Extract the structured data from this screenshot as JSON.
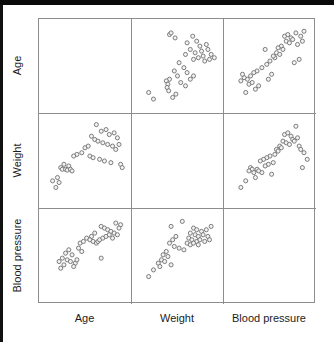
{
  "figure": {
    "type": "scatter-plot-matrix",
    "variables": [
      "Age",
      "Weight",
      "Blood pressure"
    ],
    "row_labels": [
      "Age",
      "Weight",
      "Blood pressure"
    ],
    "col_labels": [
      "Age",
      "Weight",
      "Blood pressure"
    ],
    "marker": {
      "shape": "open-circle",
      "radius_px": 2.2,
      "fill": "#f2f2f2",
      "stroke": "#6f6f6f"
    },
    "grid_line_color": "#8d8d8d",
    "background": "#ffffff",
    "diagonal": "empty"
  },
  "chart_data": {
    "type": "scatter",
    "title": "",
    "xlabel": "",
    "ylabel": "",
    "grid": false,
    "legend": null,
    "matrix": {
      "rows": [
        "Age",
        "Weight",
        "Blood pressure"
      ],
      "cols": [
        "Age",
        "Weight",
        "Blood pressure"
      ],
      "diagonal_empty": true,
      "n_points": 38,
      "axis_range_normalized": [
        0,
        100
      ]
    },
    "panels": [
      {
        "row": "Age",
        "col": "Age",
        "empty": true,
        "points": []
      },
      {
        "row": "Age",
        "col": "Weight",
        "empty": false,
        "xlabel": "Weight",
        "ylabel": "Age",
        "points": [
          [
            40,
            12
          ],
          [
            42,
            10
          ],
          [
            47,
            16
          ],
          [
            62,
            22
          ],
          [
            69,
            14
          ],
          [
            74,
            20
          ],
          [
            78,
            26
          ],
          [
            66,
            30
          ],
          [
            72,
            34
          ],
          [
            60,
            36
          ],
          [
            80,
            32
          ],
          [
            86,
            24
          ],
          [
            88,
            30
          ],
          [
            92,
            36
          ],
          [
            70,
            42
          ],
          [
            76,
            40
          ],
          [
            82,
            38
          ],
          [
            84,
            44
          ],
          [
            90,
            42
          ],
          [
            96,
            40
          ],
          [
            52,
            46
          ],
          [
            58,
            52
          ],
          [
            46,
            56
          ],
          [
            62,
            58
          ],
          [
            50,
            62
          ],
          [
            40,
            66
          ],
          [
            36,
            68
          ],
          [
            38,
            72
          ],
          [
            37,
            76
          ],
          [
            39,
            80
          ],
          [
            54,
            70
          ],
          [
            60,
            74
          ],
          [
            66,
            66
          ],
          [
            70,
            62
          ],
          [
            48,
            84
          ],
          [
            14,
            82
          ],
          [
            20,
            90
          ],
          [
            44,
            88
          ]
        ]
      },
      {
        "row": "Age",
        "col": "Blood pressure",
        "empty": false,
        "xlabel": "Blood pressure",
        "ylabel": "Age",
        "points": [
          [
            68,
            14
          ],
          [
            72,
            12
          ],
          [
            76,
            16
          ],
          [
            82,
            10
          ],
          [
            88,
            14
          ],
          [
            92,
            8
          ],
          [
            70,
            20
          ],
          [
            74,
            22
          ],
          [
            78,
            18
          ],
          [
            84,
            24
          ],
          [
            90,
            20
          ],
          [
            64,
            26
          ],
          [
            66,
            30
          ],
          [
            60,
            28
          ],
          [
            58,
            34
          ],
          [
            62,
            36
          ],
          [
            56,
            40
          ],
          [
            54,
            38
          ],
          [
            50,
            44
          ],
          [
            44,
            30
          ],
          [
            46,
            48
          ],
          [
            86,
            42
          ],
          [
            80,
            46
          ],
          [
            40,
            52
          ],
          [
            34,
            56
          ],
          [
            30,
            58
          ],
          [
            26,
            62
          ],
          [
            22,
            66
          ],
          [
            18,
            64
          ],
          [
            14,
            68
          ],
          [
            24,
            72
          ],
          [
            28,
            70
          ],
          [
            36,
            74
          ],
          [
            32,
            78
          ],
          [
            20,
            82
          ],
          [
            16,
            60
          ],
          [
            48,
            66
          ],
          [
            52,
            60
          ]
        ]
      },
      {
        "row": "Weight",
        "col": "Age",
        "empty": false,
        "xlabel": "Age",
        "ylabel": "Weight",
        "points": [
          [
            64,
            6
          ],
          [
            70,
            14
          ],
          [
            76,
            12
          ],
          [
            80,
            18
          ],
          [
            86,
            16
          ],
          [
            90,
            22
          ],
          [
            58,
            20
          ],
          [
            62,
            24
          ],
          [
            66,
            26
          ],
          [
            72,
            28
          ],
          [
            78,
            30
          ],
          [
            84,
            32
          ],
          [
            88,
            36
          ],
          [
            92,
            30
          ],
          [
            50,
            34
          ],
          [
            54,
            32
          ],
          [
            46,
            40
          ],
          [
            40,
            42
          ],
          [
            36,
            44
          ],
          [
            56,
            44
          ],
          [
            60,
            46
          ],
          [
            68,
            48
          ],
          [
            74,
            50
          ],
          [
            82,
            52
          ],
          [
            94,
            54
          ],
          [
            96,
            58
          ],
          [
            30,
            56
          ],
          [
            24,
            54
          ],
          [
            20,
            58
          ],
          [
            22,
            60
          ],
          [
            26,
            60
          ],
          [
            28,
            61
          ],
          [
            32,
            60
          ],
          [
            34,
            62
          ],
          [
            16,
            70
          ],
          [
            10,
            74
          ],
          [
            14,
            82
          ],
          [
            18,
            76
          ]
        ]
      },
      {
        "row": "Weight",
        "col": "Weight",
        "empty": true,
        "points": []
      },
      {
        "row": "Weight",
        "col": "Blood pressure",
        "empty": false,
        "xlabel": "Blood pressure",
        "ylabel": "Weight",
        "points": [
          [
            82,
            8
          ],
          [
            68,
            18
          ],
          [
            72,
            16
          ],
          [
            76,
            20
          ],
          [
            78,
            24
          ],
          [
            66,
            26
          ],
          [
            70,
            28
          ],
          [
            74,
            30
          ],
          [
            80,
            26
          ],
          [
            84,
            22
          ],
          [
            62,
            32
          ],
          [
            64,
            34
          ],
          [
            58,
            36
          ],
          [
            60,
            38
          ],
          [
            86,
            32
          ],
          [
            88,
            36
          ],
          [
            92,
            40
          ],
          [
            56,
            42
          ],
          [
            50,
            44
          ],
          [
            46,
            46
          ],
          [
            42,
            48
          ],
          [
            38,
            50
          ],
          [
            54,
            52
          ],
          [
            48,
            54
          ],
          [
            44,
            56
          ],
          [
            26,
            58
          ],
          [
            28,
            60
          ],
          [
            24,
            62
          ],
          [
            30,
            64
          ],
          [
            34,
            60
          ],
          [
            36,
            62
          ],
          [
            40,
            64
          ],
          [
            52,
            66
          ],
          [
            90,
            58
          ],
          [
            96,
            48
          ],
          [
            20,
            74
          ],
          [
            14,
            82
          ],
          [
            32,
            70
          ]
        ]
      },
      {
        "row": "Blood pressure",
        "col": "Age",
        "empty": false,
        "xlabel": "Age",
        "ylabel": "Blood pressure",
        "points": [
          [
            88,
            10
          ],
          [
            94,
            12
          ],
          [
            92,
            16
          ],
          [
            70,
            14
          ],
          [
            74,
            16
          ],
          [
            78,
            18
          ],
          [
            82,
            20
          ],
          [
            86,
            22
          ],
          [
            90,
            24
          ],
          [
            62,
            22
          ],
          [
            58,
            26
          ],
          [
            52,
            28
          ],
          [
            56,
            30
          ],
          [
            60,
            32
          ],
          [
            64,
            34
          ],
          [
            66,
            32
          ],
          [
            68,
            30
          ],
          [
            72,
            28
          ],
          [
            76,
            26
          ],
          [
            80,
            24
          ],
          [
            84,
            28
          ],
          [
            44,
            34
          ],
          [
            48,
            32
          ],
          [
            42,
            40
          ],
          [
            46,
            44
          ],
          [
            30,
            42
          ],
          [
            26,
            46
          ],
          [
            34,
            48
          ],
          [
            22,
            52
          ],
          [
            28,
            54
          ],
          [
            32,
            56
          ],
          [
            38,
            58
          ],
          [
            24,
            60
          ],
          [
            36,
            62
          ],
          [
            20,
            64
          ],
          [
            70,
            52
          ],
          [
            18,
            56
          ],
          [
            40,
            54
          ]
        ]
      },
      {
        "row": "Blood pressure",
        "col": "Weight",
        "empty": false,
        "xlabel": "Weight",
        "ylabel": "Blood pressure",
        "points": [
          [
            56,
            8
          ],
          [
            42,
            14
          ],
          [
            70,
            16
          ],
          [
            74,
            18
          ],
          [
            80,
            20
          ],
          [
            86,
            18
          ],
          [
            92,
            14
          ],
          [
            66,
            22
          ],
          [
            72,
            24
          ],
          [
            76,
            26
          ],
          [
            82,
            24
          ],
          [
            88,
            26
          ],
          [
            64,
            28
          ],
          [
            68,
            30
          ],
          [
            74,
            32
          ],
          [
            78,
            30
          ],
          [
            84,
            32
          ],
          [
            90,
            30
          ],
          [
            62,
            34
          ],
          [
            66,
            36
          ],
          [
            70,
            34
          ],
          [
            76,
            36
          ],
          [
            48,
            26
          ],
          [
            44,
            30
          ],
          [
            40,
            34
          ],
          [
            46,
            38
          ],
          [
            52,
            40
          ],
          [
            58,
            42
          ],
          [
            36,
            44
          ],
          [
            32,
            48
          ],
          [
            38,
            50
          ],
          [
            30,
            54
          ],
          [
            34,
            56
          ],
          [
            26,
            58
          ],
          [
            42,
            60
          ],
          [
            28,
            62
          ],
          [
            20,
            66
          ],
          [
            14,
            74
          ]
        ]
      },
      {
        "row": "Blood pressure",
        "col": "Blood pressure",
        "empty": true,
        "points": []
      }
    ]
  }
}
